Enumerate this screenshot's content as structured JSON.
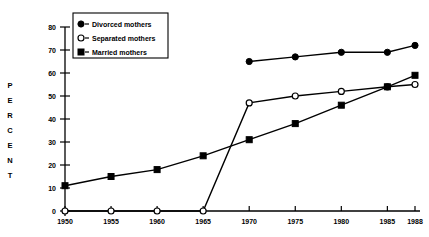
{
  "chart_data": {
    "type": "line",
    "title": "",
    "xlabel": "",
    "ylabel": "PERCENT",
    "x": [
      1950,
      1955,
      1960,
      1965,
      1970,
      1975,
      1980,
      1985,
      1988
    ],
    "xtick_labels": [
      "1950",
      "1955",
      "1960",
      "1965",
      "1970",
      "1975",
      "1980",
      "1985",
      "1988"
    ],
    "ytick_labels": [
      "0",
      "10",
      "20",
      "30",
      "40",
      "50",
      "60",
      "70",
      "80"
    ],
    "yticks": [
      0,
      10,
      20,
      30,
      40,
      50,
      60,
      70,
      80
    ],
    "ylim": [
      0,
      80
    ],
    "xlim": [
      1950,
      1988
    ],
    "grid": false,
    "legend_position": "top-left-inside",
    "series": [
      {
        "name": "Divorced  mothers",
        "marker": "filled-circle",
        "x": [
          1970,
          1975,
          1980,
          1985,
          1988
        ],
        "values": [
          65,
          67,
          69,
          69,
          72
        ]
      },
      {
        "name": "Separated  mothers",
        "marker": "open-circle",
        "x": [
          1950,
          1955,
          1960,
          1965,
          1970,
          1975,
          1980,
          1985,
          1988
        ],
        "values": [
          0,
          0,
          0,
          0,
          47,
          50,
          52,
          54,
          55
        ]
      },
      {
        "name": "Married  mothers",
        "marker": "filled-square",
        "x": [
          1950,
          1955,
          1960,
          1965,
          1970,
          1975,
          1980,
          1985,
          1988
        ],
        "values": [
          11,
          15,
          18,
          24,
          31,
          38,
          46,
          54,
          59
        ]
      }
    ]
  },
  "axis": {
    "y_axis_title_letters": [
      "P",
      "E",
      "R",
      "C",
      "E",
      "N",
      "T"
    ]
  },
  "legend": {
    "entries": [
      {
        "label": "Divorced  mothers",
        "marker": "filled-circle"
      },
      {
        "label": "Separated  mothers",
        "marker": "open-circle"
      },
      {
        "label": "Married  mothers",
        "marker": "filled-square"
      }
    ]
  },
  "colors": {
    "ink": "#000000",
    "background": "#ffffff"
  }
}
